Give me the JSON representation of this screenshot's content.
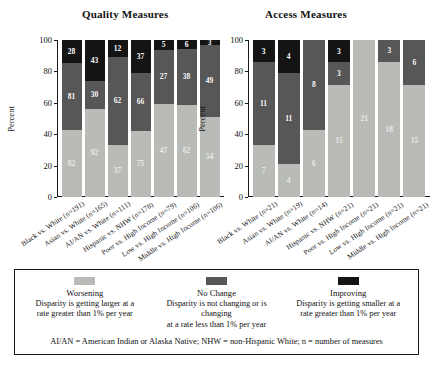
{
  "colors": {
    "worsening": "#b9bbb6",
    "no_change": "#575757",
    "improving": "#141414",
    "axis": "#1a1a1a"
  },
  "panels": {
    "quality": {
      "title": "Quality Measures"
    },
    "access": {
      "title": "Access Measures"
    }
  },
  "axis": {
    "ylabel": "Percent",
    "yticks": [
      "0",
      "20",
      "40",
      "60",
      "80",
      "100"
    ]
  },
  "legend": {
    "items": [
      {
        "key": "worsening",
        "label": "Worsening",
        "desc_line1": "Disparity is getting larger at a",
        "desc_line2": "rate greater than 1% per year",
        "color": "#b9bbb6"
      },
      {
        "key": "no_change",
        "label": "No Change",
        "desc_line1": "Disparity is not changing or is changing",
        "desc_line2": "at a rate less than 1% per year",
        "color": "#575757"
      },
      {
        "key": "improving",
        "label": "Improving",
        "desc_line1": "Disparity is getting smaller at a",
        "desc_line2": "rate greater than 1% per year",
        "color": "#141414"
      }
    ],
    "footnote": "AI/AN = American Indian or Alaska Native; NHW = non-Hispanic White; n = number of measures"
  },
  "chart_data": [
    {
      "type": "bar",
      "stacked": true,
      "title": "Quality Measures",
      "xlabel": "",
      "ylabel": "Percent",
      "ylim": [
        0,
        100
      ],
      "yticks": [
        0,
        20,
        40,
        60,
        80,
        100
      ],
      "grid": false,
      "legend_position": "below",
      "value_labels": "counts",
      "categories": [
        "Black vs. White (n=191)",
        "Asian vs. White (n=165)",
        "AI/AN vs. White (n=111)",
        "Hispanic vs. NHW (n=178)",
        "Poor vs. High Income (n=79)",
        "Low vs. High Income (n=106)",
        "Middle vs. High Income (n=106)"
      ],
      "series": [
        {
          "name": "Worsening",
          "color": "#b9bbb6",
          "counts": [
            82,
            92,
            37,
            75,
            47,
            62,
            54
          ],
          "percents": [
            42.9,
            55.8,
            33.3,
            42.1,
            59.5,
            58.5,
            50.9
          ]
        },
        {
          "name": "No Change",
          "color": "#575757",
          "counts": [
            81,
            30,
            62,
            66,
            27,
            38,
            49
          ],
          "percents": [
            42.4,
            18.2,
            55.9,
            37.1,
            34.2,
            35.8,
            46.2
          ]
        },
        {
          "name": "Improving",
          "color": "#141414",
          "counts": [
            28,
            43,
            12,
            37,
            5,
            6,
            3
          ],
          "percents": [
            14.7,
            26.0,
            10.8,
            20.8,
            6.3,
            5.7,
            2.9
          ]
        }
      ]
    },
    {
      "type": "bar",
      "stacked": true,
      "title": "Access Measures",
      "xlabel": "",
      "ylabel": "Percent",
      "ylim": [
        0,
        100
      ],
      "yticks": [
        0,
        20,
        40,
        60,
        80,
        100
      ],
      "grid": false,
      "legend_position": "below",
      "value_labels": "counts",
      "categories": [
        "Black vs. White (n=21)",
        "Asian vs. White (n=19)",
        "AI/AN vs. White (n=14)",
        "Hispanic vs. NHW (n=21)",
        "Poor vs. High Income (n=21)",
        "Low vs. High Income (n=21)",
        "Middle vs. High Income (n=21)"
      ],
      "series": [
        {
          "name": "Worsening",
          "color": "#b9bbb6",
          "counts": [
            7,
            4,
            6,
            15,
            21,
            18,
            15
          ],
          "percents": [
            33.3,
            21.1,
            42.9,
            71.4,
            100.0,
            85.7,
            71.4
          ]
        },
        {
          "name": "No Change",
          "color": "#575757",
          "counts": [
            11,
            11,
            8,
            3,
            0,
            3,
            6
          ],
          "percents": [
            52.4,
            57.9,
            57.1,
            14.3,
            0.0,
            14.3,
            28.6
          ]
        },
        {
          "name": "Improving",
          "color": "#141414",
          "counts": [
            3,
            4,
            0,
            3,
            0,
            0,
            0
          ],
          "percents": [
            14.3,
            21.1,
            0.0,
            14.3,
            0.0,
            0.0,
            0.0
          ]
        }
      ]
    }
  ]
}
